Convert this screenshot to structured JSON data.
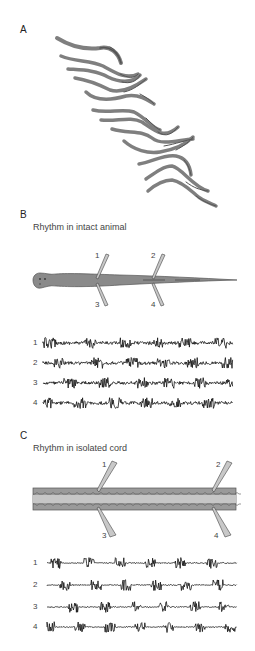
{
  "figure": {
    "panels": [
      {
        "label": "A",
        "title": "",
        "description": "Sequential body outlines of a swimming animal showing traveling undulatory wave",
        "frames": 12
      },
      {
        "label": "B",
        "title": "Rhythm in intact animal",
        "electrodes": [
          "1",
          "2",
          "3",
          "4"
        ],
        "traces": [
          "1",
          "2",
          "3",
          "4"
        ]
      },
      {
        "label": "C",
        "title": "Rhythm in isolated cord",
        "electrodes": [
          "1",
          "2",
          "3",
          "4"
        ],
        "traces": [
          "1",
          "2",
          "3",
          "4"
        ]
      }
    ]
  },
  "colors": {
    "body_fill": "#8a8a8a",
    "body_stroke": "#555555",
    "cord_fill": "#9a9a9a",
    "cord_center": "#c4c4c4",
    "trace": "#111111",
    "electrode": "#bdbdbd"
  }
}
